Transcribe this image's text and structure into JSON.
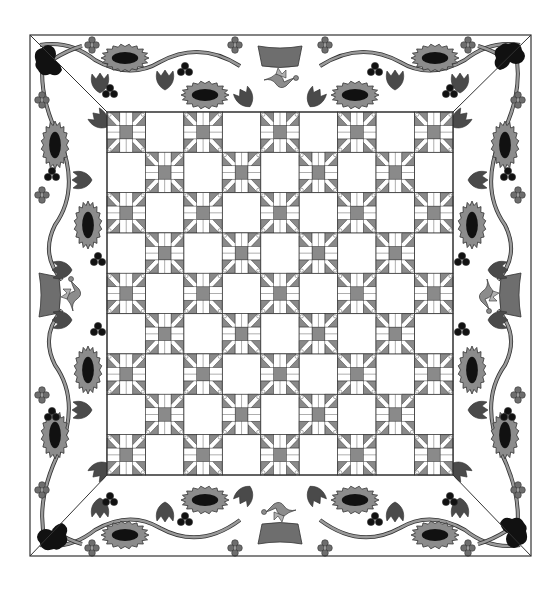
{
  "colors": {
    "background": "#ffffff",
    "outline": "#333333",
    "light_gray": "#8c8c8c",
    "mid_gray": "#6e6e6e",
    "dark_gray": "#4a4a4a",
    "black": "#111111",
    "stem": "#9a9a9a",
    "block_gray": "#8a8a8a"
  },
  "quilt": {
    "outer": {
      "x": 30,
      "y": 35,
      "w": 501,
      "h": 521
    },
    "inner": {
      "x": 107,
      "y": 112,
      "w": 346,
      "h": 363
    },
    "grid": {
      "cols": 9,
      "rows": 9
    },
    "pattern": "checkerboard of pieced blocks and plain squares; pieced block in corners"
  },
  "border": {
    "center_motifs": [
      {
        "side": "top",
        "type": "basket-with-bird",
        "x": 280,
        "y": 72
      },
      {
        "side": "bottom",
        "type": "basket-with-bird",
        "x": 280,
        "y": 518
      },
      {
        "side": "left",
        "type": "basket-with-bird",
        "x": 65,
        "y": 295
      },
      {
        "side": "right",
        "type": "basket-with-bird",
        "x": 495,
        "y": 295
      }
    ],
    "corner_motifs": [
      "black-rose",
      "black-rose",
      "black-rose",
      "black-rose"
    ]
  }
}
